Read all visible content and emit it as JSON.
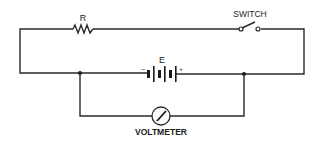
{
  "diagram": {
    "type": "circuit-schematic",
    "components": {
      "resistor": {
        "label": "R"
      },
      "switch": {
        "label": "SWITCH",
        "state": "open"
      },
      "battery": {
        "label": "E",
        "negative": "−",
        "positive": "+"
      },
      "voltmeter": {
        "label": "VOLTMETER"
      }
    },
    "colors": {
      "line": "#2a2a2a",
      "background": "#ffffff"
    }
  }
}
